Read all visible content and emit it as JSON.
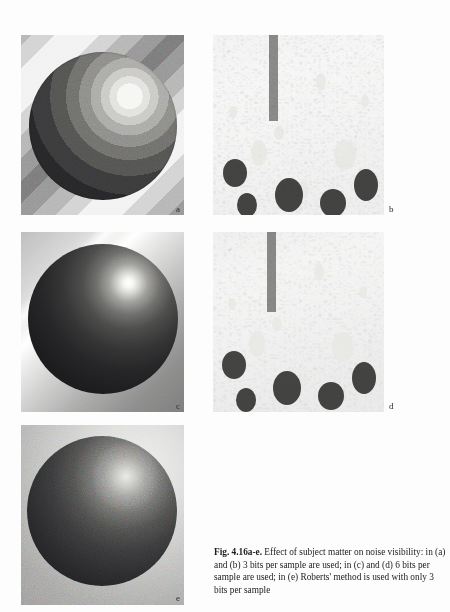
{
  "figure": {
    "id": "Fig. 4.16a-e.",
    "caption_bold": "Fig. 4.16a-e.",
    "caption_text": " Effect of subject matter on noise visibility: in (a) and (b) 3 bits per sample are used; in (c) and (d) 6 bits per sample are used; in (e) Roberts' method is used with only 3 bits per sample",
    "caption_full": "Fig. 4.16a-e. Effect of subject matter on noise visibility: in (a) and (b) 3 bits per sample are used; in (c) and (d) 6 bits per sample are used; in (e) Roberts' method is used with only 3 bits per sample",
    "panels": [
      {
        "label": "a",
        "subject": "shaded-sphere-on-striped-background",
        "bits_per_sample": 3,
        "method": "uniform quantization",
        "appearance": "strong false contouring / banding on sphere and background",
        "row": 1,
        "column": 1
      },
      {
        "label": "b",
        "subject": "crowd-photograph",
        "bits_per_sample": 3,
        "method": "uniform quantization",
        "appearance": "busy detail masks the quantization noise",
        "row": 1,
        "column": 2
      },
      {
        "label": "c",
        "subject": "shaded-sphere-on-striped-background",
        "bits_per_sample": 6,
        "method": "uniform quantization",
        "appearance": "smooth shading, no visible contours",
        "row": 2,
        "column": 1
      },
      {
        "label": "d",
        "subject": "crowd-photograph",
        "bits_per_sample": 6,
        "method": "uniform quantization",
        "appearance": "smooth, full tonal detail",
        "row": 2,
        "column": 2
      },
      {
        "label": "e",
        "subject": "shaded-sphere-on-striped-background",
        "bits_per_sample": 3,
        "method": "Roberts' pseudo-random noise dithering",
        "appearance": "granular noise replaces contouring",
        "row": 3,
        "column": 1
      }
    ]
  },
  "colors": {
    "page_background": "#fdfdfd",
    "caption_text": "#1b1b1b",
    "panel_label": "#2a2a2a"
  }
}
